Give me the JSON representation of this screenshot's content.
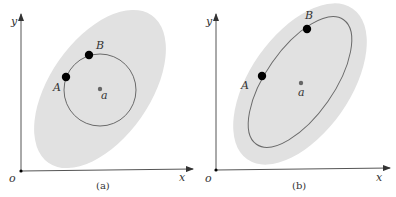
{
  "figure": {
    "colors": {
      "region_fill": "#e1e1e1",
      "curve_stroke": "#6a6a6a",
      "axis_stroke": "#555555",
      "point_fill": "#000000",
      "center_fill": "#666666"
    },
    "panels": [
      {
        "id": "a",
        "caption": "(a)",
        "axes": {
          "x_label": "x",
          "y_label": "y",
          "origin_label": "o"
        },
        "region": "large tilted gray ellipse",
        "curve": "circle centered at a",
        "points": [
          {
            "label": "A"
          },
          {
            "label": "B"
          }
        ],
        "center_label": "a"
      },
      {
        "id": "b",
        "caption": "(b)",
        "axes": {
          "x_label": "x",
          "y_label": "y",
          "origin_label": "o"
        },
        "region": "large tilted gray ellipse",
        "curve": "tilted ellipse centered at a",
        "points": [
          {
            "label": "A"
          },
          {
            "label": "B"
          }
        ],
        "center_label": "a"
      }
    ]
  }
}
